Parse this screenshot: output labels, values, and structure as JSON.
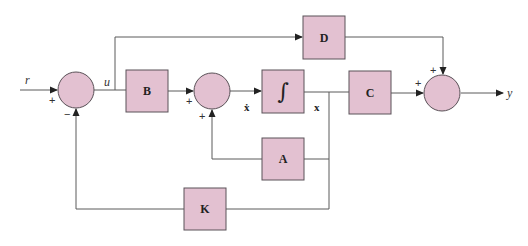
{
  "diagram": {
    "type": "state-feedback block diagram",
    "colors": {
      "block_fill": "#e3c1d1",
      "line": "#5a5a5a"
    },
    "blocks": {
      "B": "B",
      "integrator": "∫",
      "C": "C",
      "D": "D",
      "A": "A",
      "K": "K"
    },
    "signals": {
      "r": "r",
      "u": "u",
      "xdot": "ẋ",
      "x": "x",
      "y": "y"
    },
    "signs": {
      "sum1_top": "+",
      "sum1_bottom": "−",
      "sum2_left": "+",
      "sum2_bottom": "+",
      "sum3_left": "+",
      "sum3_top": "+"
    }
  }
}
